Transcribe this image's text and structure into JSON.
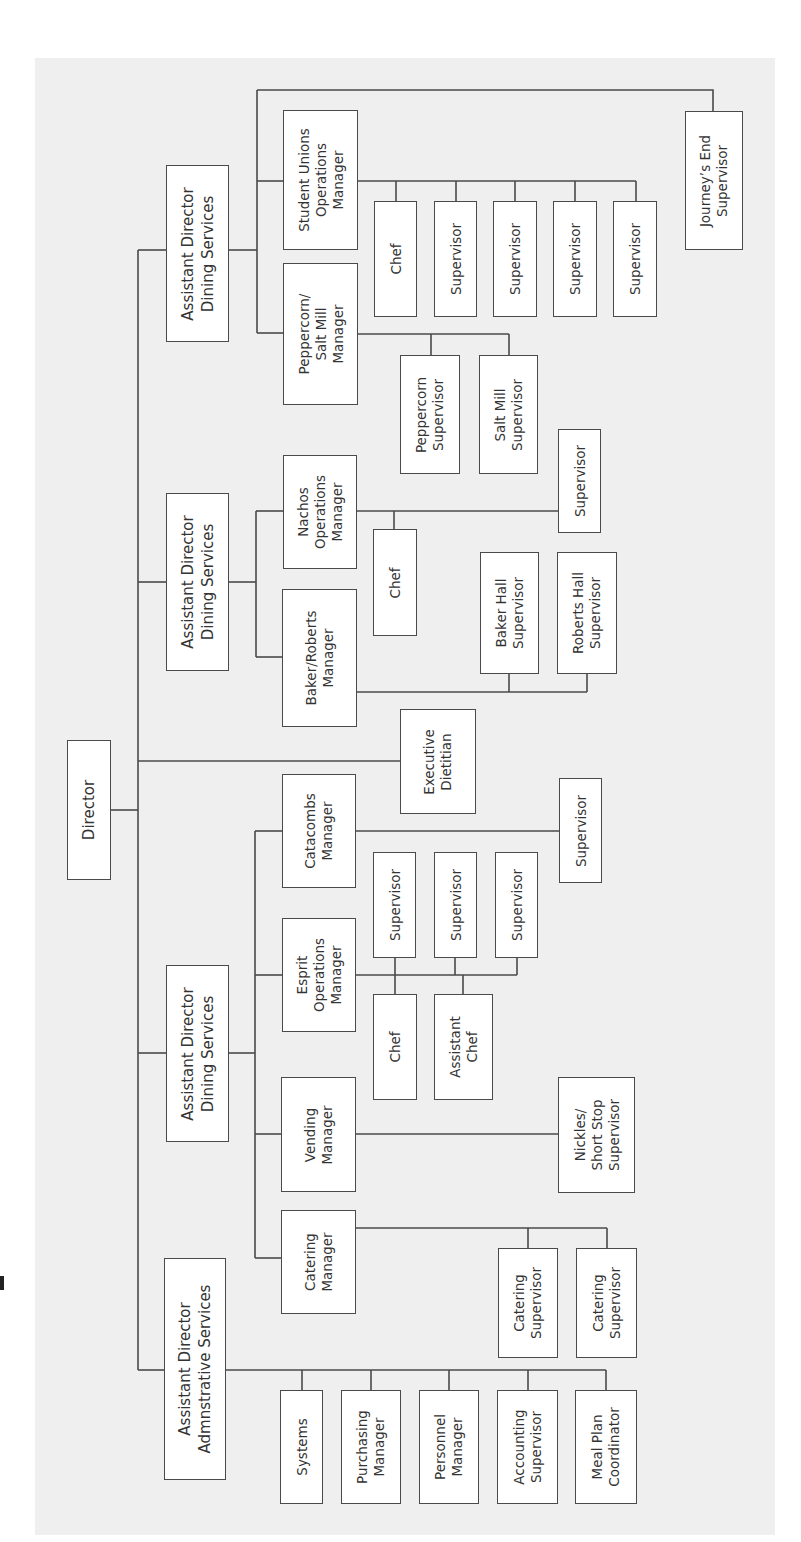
{
  "colors": {
    "panel": "#efefef",
    "box_fill": "#ffffff",
    "line": "#4a4a4a",
    "text": "#333333"
  },
  "nodes": [
    {
      "id": "director",
      "label": "Director",
      "x": 67,
      "y": 740,
      "w": 44,
      "h": 140,
      "big": true
    },
    {
      "id": "ad-dining-1",
      "label": "Assistant Director\nDining Services",
      "x": 166,
      "y": 165,
      "w": 63,
      "h": 177,
      "big": true
    },
    {
      "id": "ad-dining-2",
      "label": "Assistant Director\nDining Services",
      "x": 166,
      "y": 493,
      "w": 63,
      "h": 178,
      "big": true
    },
    {
      "id": "ad-dining-3",
      "label": "Assistant Director\nDining Services",
      "x": 166,
      "y": 965,
      "w": 63,
      "h": 177,
      "big": true
    },
    {
      "id": "ad-admin",
      "label": "Assistant Director\nAdmnstrative Services",
      "x": 164,
      "y": 1258,
      "w": 62,
      "h": 222,
      "big": true
    },
    {
      "id": "executive-dietitian",
      "label": "Executive\nDietitian",
      "x": 400,
      "y": 709,
      "w": 76,
      "h": 105
    },
    {
      "id": "student-unions-ops-manager",
      "label": "Student Unions\nOperations\nManager",
      "x": 283,
      "y": 110,
      "w": 75,
      "h": 140
    },
    {
      "id": "peppercorn-salt-mill-manager",
      "label": "Peppercorn/\nSalt Mill\nManager",
      "x": 283,
      "y": 263,
      "w": 75,
      "h": 142
    },
    {
      "id": "journeys-end-supervisor",
      "label": "Journey’s End\nSupervisor",
      "x": 685,
      "y": 111,
      "w": 58,
      "h": 139
    },
    {
      "id": "su-chef",
      "label": "Chef",
      "x": 374,
      "y": 201,
      "w": 43,
      "h": 116
    },
    {
      "id": "su-supervisor-1",
      "label": "Supervisor",
      "x": 434,
      "y": 201,
      "w": 43,
      "h": 116
    },
    {
      "id": "su-supervisor-2",
      "label": "Supervisor",
      "x": 493,
      "y": 201,
      "w": 44,
      "h": 116
    },
    {
      "id": "su-supervisor-3",
      "label": "Supervisor",
      "x": 553,
      "y": 201,
      "w": 44,
      "h": 116
    },
    {
      "id": "su-supervisor-4",
      "label": "Supervisor",
      "x": 613,
      "y": 201,
      "w": 44,
      "h": 116
    },
    {
      "id": "peppercorn-supervisor",
      "label": "Peppercorn\nSupervisor",
      "x": 400,
      "y": 355,
      "w": 60,
      "h": 119
    },
    {
      "id": "salt-mill-supervisor",
      "label": "Salt Mill\nSupervisor",
      "x": 479,
      "y": 355,
      "w": 59,
      "h": 119
    },
    {
      "id": "nachos-ops-manager",
      "label": "Nachos\nOperations\nManager",
      "x": 283,
      "y": 455,
      "w": 74,
      "h": 114
    },
    {
      "id": "baker-roberts-manager",
      "label": "Baker/Roberts\nManager",
      "x": 282,
      "y": 589,
      "w": 75,
      "h": 138
    },
    {
      "id": "nachos-chef",
      "label": "Chef",
      "x": 373,
      "y": 529,
      "w": 44,
      "h": 107
    },
    {
      "id": "nachos-supervisor",
      "label": "Supervisor",
      "x": 558,
      "y": 429,
      "w": 43,
      "h": 104
    },
    {
      "id": "baker-hall-supervisor",
      "label": "Baker Hall\nSupervisor",
      "x": 480,
      "y": 552,
      "w": 59,
      "h": 122
    },
    {
      "id": "roberts-hall-supervisor",
      "label": "Roberts Hall\nSupervisor",
      "x": 557,
      "y": 552,
      "w": 60,
      "h": 122
    },
    {
      "id": "catacombs-manager",
      "label": "Catacombs\nManager",
      "x": 282,
      "y": 774,
      "w": 74,
      "h": 114
    },
    {
      "id": "esprit-ops-manager",
      "label": "Esprit\nOperations\nManager",
      "x": 282,
      "y": 918,
      "w": 74,
      "h": 114
    },
    {
      "id": "catacombs-supervisor",
      "label": "Supervisor",
      "x": 559,
      "y": 778,
      "w": 43,
      "h": 105
    },
    {
      "id": "esprit-supervisor-1",
      "label": "Supervisor",
      "x": 373,
      "y": 852,
      "w": 43,
      "h": 106
    },
    {
      "id": "esprit-supervisor-2",
      "label": "Supervisor",
      "x": 434,
      "y": 852,
      "w": 43,
      "h": 106
    },
    {
      "id": "esprit-supervisor-3",
      "label": "Supervisor",
      "x": 495,
      "y": 852,
      "w": 43,
      "h": 106
    },
    {
      "id": "esprit-chef",
      "label": "Chef",
      "x": 373,
      "y": 994,
      "w": 44,
      "h": 106
    },
    {
      "id": "esprit-assistant-chef",
      "label": "Assistant\nChef",
      "x": 434,
      "y": 994,
      "w": 59,
      "h": 106
    },
    {
      "id": "vending-manager",
      "label": "Vending\nManager",
      "x": 281,
      "y": 1077,
      "w": 75,
      "h": 115
    },
    {
      "id": "catering-manager",
      "label": "Catering\nManager",
      "x": 281,
      "y": 1210,
      "w": 75,
      "h": 104
    },
    {
      "id": "nickles-short-stop-supervisor",
      "label": "Nickles/\nShort Stop\nSupervisor",
      "x": 558,
      "y": 1077,
      "w": 77,
      "h": 116
    },
    {
      "id": "catering-supervisor-1",
      "label": "Catering\nSupervisor",
      "x": 498,
      "y": 1248,
      "w": 60,
      "h": 110
    },
    {
      "id": "catering-supervisor-2",
      "label": "Catering\nSupervisor",
      "x": 576,
      "y": 1248,
      "w": 61,
      "h": 110
    },
    {
      "id": "systems",
      "label": "Systems",
      "x": 280,
      "y": 1390,
      "w": 43,
      "h": 114
    },
    {
      "id": "purchasing-manager",
      "label": "Purchasing\nManager",
      "x": 341,
      "y": 1390,
      "w": 60,
      "h": 114
    },
    {
      "id": "personnel-manager",
      "label": "Personnel\nManager",
      "x": 419,
      "y": 1390,
      "w": 60,
      "h": 114
    },
    {
      "id": "accounting-supervisor",
      "label": "Accounting\nSupervisor",
      "x": 497,
      "y": 1390,
      "w": 61,
      "h": 114
    },
    {
      "id": "meal-plan-coordinator",
      "label": "Meal Plan\nCoordinator",
      "x": 575,
      "y": 1390,
      "w": 62,
      "h": 114
    }
  ],
  "connectors": [
    {
      "from": "director",
      "to": "spine",
      "points": [
        [
          111,
          810
        ],
        [
          138,
          810
        ]
      ]
    },
    {
      "from": "spine",
      "to": "all",
      "points": [
        [
          138,
          250
        ],
        [
          138,
          1370
        ]
      ]
    },
    {
      "from": "spine",
      "to": "ad-dining-1",
      "points": [
        [
          138,
          250
        ],
        [
          166,
          250
        ]
      ]
    },
    {
      "from": "spine",
      "to": "ad-dining-2",
      "points": [
        [
          138,
          582
        ],
        [
          166,
          582
        ]
      ]
    },
    {
      "from": "spine",
      "to": "executive-dietitian",
      "points": [
        [
          138,
          761
        ],
        [
          400,
          761
        ]
      ]
    },
    {
      "from": "spine",
      "to": "ad-dining-3",
      "points": [
        [
          138,
          1053
        ],
        [
          166,
          1053
        ]
      ]
    },
    {
      "from": "spine",
      "to": "ad-admin",
      "points": [
        [
          138,
          1370
        ],
        [
          164,
          1370
        ]
      ]
    },
    {
      "from": "ad-dining-1",
      "to": "sub-spine-1",
      "points": [
        [
          229,
          250
        ],
        [
          257,
          250
        ]
      ]
    },
    {
      "from": "sub-spine-1",
      "to": "all",
      "points": [
        [
          257,
          90
        ],
        [
          257,
          333
        ]
      ]
    },
    {
      "from": "sub-spine-1",
      "to": "student-unions-ops-manager",
      "points": [
        [
          257,
          181
        ],
        [
          283,
          181
        ]
      ]
    },
    {
      "from": "sub-spine-1",
      "to": "peppercorn-salt-mill-manager",
      "points": [
        [
          257,
          333
        ],
        [
          283,
          333
        ]
      ]
    },
    {
      "from": "sub-spine-1",
      "to": "journeys-end-supervisor",
      "points": [
        [
          257,
          90
        ],
        [
          713,
          90
        ],
        [
          713,
          111
        ]
      ]
    },
    {
      "from": "student-unions-ops-manager",
      "to": "su-row",
      "points": [
        [
          358,
          181
        ],
        [
          636,
          181
        ]
      ]
    },
    {
      "from": "su-row",
      "to": "su-chef",
      "points": [
        [
          396,
          181
        ],
        [
          396,
          201
        ]
      ]
    },
    {
      "from": "su-row",
      "to": "su-supervisor-1",
      "points": [
        [
          456,
          181
        ],
        [
          456,
          201
        ]
      ]
    },
    {
      "from": "su-row",
      "to": "su-supervisor-2",
      "points": [
        [
          515,
          181
        ],
        [
          515,
          201
        ]
      ]
    },
    {
      "from": "su-row",
      "to": "su-supervisor-3",
      "points": [
        [
          575,
          181
        ],
        [
          575,
          201
        ]
      ]
    },
    {
      "from": "su-row",
      "to": "su-supervisor-4",
      "points": [
        [
          636,
          181
        ],
        [
          636,
          201
        ]
      ]
    },
    {
      "from": "peppercorn-salt-mill-manager",
      "to": "pep-row",
      "points": [
        [
          358,
          334
        ],
        [
          509,
          334
        ]
      ]
    },
    {
      "from": "pep-row",
      "to": "peppercorn-supervisor",
      "points": [
        [
          431,
          334
        ],
        [
          431,
          355
        ]
      ]
    },
    {
      "from": "pep-row",
      "to": "salt-mill-supervisor",
      "points": [
        [
          509,
          334
        ],
        [
          509,
          355
        ]
      ]
    },
    {
      "from": "ad-dining-2",
      "to": "sub-spine-2",
      "points": [
        [
          229,
          582
        ],
        [
          256,
          582
        ]
      ]
    },
    {
      "from": "sub-spine-2",
      "to": "all",
      "points": [
        [
          256,
          511
        ],
        [
          256,
          657
        ]
      ]
    },
    {
      "from": "sub-spine-2",
      "to": "nachos-ops-manager",
      "points": [
        [
          256,
          511
        ],
        [
          283,
          511
        ]
      ]
    },
    {
      "from": "sub-spine-2",
      "to": "baker-roberts-manager",
      "points": [
        [
          256,
          657
        ],
        [
          282,
          657
        ]
      ]
    },
    {
      "from": "nachos-ops-manager",
      "to": "nachos-row",
      "points": [
        [
          357,
          511
        ],
        [
          558,
          511
        ]
      ]
    },
    {
      "from": "nachos-row",
      "to": "nachos-chef",
      "points": [
        [
          394,
          511
        ],
        [
          394,
          529
        ]
      ]
    },
    {
      "from": "baker-roberts-manager",
      "to": "br-row",
      "points": [
        [
          357,
          692
        ],
        [
          587,
          692
        ]
      ]
    },
    {
      "from": "br-row",
      "to": "baker-hall-supervisor",
      "points": [
        [
          509,
          692
        ],
        [
          509,
          674
        ]
      ]
    },
    {
      "from": "br-row",
      "to": "roberts-hall-supervisor",
      "points": [
        [
          587,
          692
        ],
        [
          587,
          674
        ]
      ]
    },
    {
      "from": "ad-dining-3",
      "to": "sub-spine-3",
      "points": [
        [
          229,
          1053
        ],
        [
          255,
          1053
        ]
      ]
    },
    {
      "from": "sub-spine-3",
      "to": "all",
      "points": [
        [
          255,
          831
        ],
        [
          255,
          1258
        ]
      ]
    },
    {
      "from": "sub-spine-3",
      "to": "catacombs-manager",
      "points": [
        [
          255,
          831
        ],
        [
          282,
          831
        ]
      ]
    },
    {
      "from": "sub-spine-3",
      "to": "esprit-ops-manager",
      "points": [
        [
          255,
          975
        ],
        [
          282,
          975
        ]
      ]
    },
    {
      "from": "sub-spine-3",
      "to": "vending-manager",
      "points": [
        [
          255,
          1134
        ],
        [
          281,
          1134
        ]
      ]
    },
    {
      "from": "sub-spine-3",
      "to": "catering-manager",
      "points": [
        [
          255,
          1258
        ],
        [
          281,
          1258
        ]
      ]
    },
    {
      "from": "catacombs-manager",
      "to": "catacombs-supervisor",
      "points": [
        [
          356,
          831
        ],
        [
          559,
          831
        ]
      ]
    },
    {
      "from": "esprit-ops-manager",
      "to": "esprit-row",
      "points": [
        [
          356,
          975
        ],
        [
          517,
          975
        ]
      ]
    },
    {
      "from": "esprit-row",
      "to": "esprit-supervisor-1",
      "points": [
        [
          395,
          975
        ],
        [
          395,
          958
        ]
      ]
    },
    {
      "from": "esprit-row",
      "to": "esprit-supervisor-2",
      "points": [
        [
          455,
          975
        ],
        [
          455,
          958
        ]
      ]
    },
    {
      "from": "esprit-row",
      "to": "esprit-supervisor-3",
      "points": [
        [
          517,
          975
        ],
        [
          517,
          958
        ]
      ]
    },
    {
      "from": "esprit-row",
      "to": "esprit-chef",
      "points": [
        [
          395,
          975
        ],
        [
          395,
          994
        ]
      ]
    },
    {
      "from": "esprit-row",
      "to": "esprit-assistant-chef",
      "points": [
        [
          463,
          975
        ],
        [
          463,
          994
        ]
      ]
    },
    {
      "from": "vending-manager",
      "to": "nickles-short-stop-supervisor",
      "points": [
        [
          356,
          1134
        ],
        [
          558,
          1134
        ]
      ]
    },
    {
      "from": "catering-manager",
      "to": "catering-row",
      "points": [
        [
          356,
          1228
        ],
        [
          607,
          1228
        ]
      ]
    },
    {
      "from": "catering-row",
      "to": "catering-supervisor-1",
      "points": [
        [
          528,
          1228
        ],
        [
          528,
          1248
        ]
      ]
    },
    {
      "from": "catering-row",
      "to": "catering-supervisor-2",
      "points": [
        [
          607,
          1228
        ],
        [
          607,
          1248
        ]
      ]
    },
    {
      "from": "ad-admin",
      "to": "admin-row",
      "points": [
        [
          226,
          1370
        ],
        [
          606,
          1370
        ]
      ]
    },
    {
      "from": "admin-row",
      "to": "systems",
      "points": [
        [
          302,
          1370
        ],
        [
          302,
          1390
        ]
      ]
    },
    {
      "from": "admin-row",
      "to": "purchasing-manager",
      "points": [
        [
          371,
          1370
        ],
        [
          371,
          1390
        ]
      ]
    },
    {
      "from": "admin-row",
      "to": "personnel-manager",
      "points": [
        [
          449,
          1370
        ],
        [
          449,
          1390
        ]
      ]
    },
    {
      "from": "admin-row",
      "to": "accounting-supervisor",
      "points": [
        [
          528,
          1370
        ],
        [
          528,
          1390
        ]
      ]
    },
    {
      "from": "admin-row",
      "to": "meal-plan-coordinator",
      "points": [
        [
          606,
          1370
        ],
        [
          606,
          1390
        ]
      ]
    }
  ]
}
